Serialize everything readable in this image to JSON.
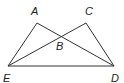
{
  "figure": {
    "type": "geometry",
    "points": {
      "A": {
        "label": "A",
        "x": 37,
        "y": 23,
        "label_x": 31,
        "label_y": 15
      },
      "C": {
        "label": "C",
        "x": 86,
        "y": 23,
        "label_x": 85,
        "label_y": 15
      },
      "B": {
        "label": "B",
        "x": 60,
        "y": 35,
        "label_x": 56,
        "label_y": 50
      },
      "E": {
        "label": "E",
        "x": 8,
        "y": 66,
        "label_x": 3,
        "label_y": 82
      },
      "D": {
        "label": "D",
        "x": 114,
        "y": 66,
        "label_x": 111,
        "label_y": 82
      }
    },
    "segments": [
      {
        "name": "segment-AE",
        "from": "A",
        "to": "E"
      },
      {
        "name": "segment-AD",
        "from": "A",
        "to": "D"
      },
      {
        "name": "segment-CE",
        "from": "C",
        "to": "E"
      },
      {
        "name": "segment-CD",
        "from": "C",
        "to": "D"
      },
      {
        "name": "segment-ED",
        "from": "E",
        "to": "D"
      }
    ],
    "colors": {
      "stroke": "#333333",
      "label": "#222222",
      "background": "#ffffff"
    }
  }
}
